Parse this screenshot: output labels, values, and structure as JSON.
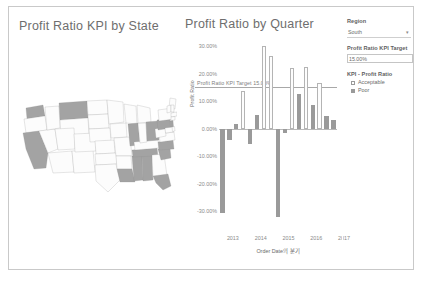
{
  "map_panel": {
    "title": "Profit Ratio KPI by State",
    "states": [
      {
        "name": "WA",
        "kpi": "Poor"
      },
      {
        "name": "OR",
        "kpi": "Acceptable"
      },
      {
        "name": "CA",
        "kpi": "Poor"
      },
      {
        "name": "NV",
        "kpi": "Acceptable"
      },
      {
        "name": "ID",
        "kpi": "Acceptable"
      },
      {
        "name": "MT",
        "kpi": "Poor"
      },
      {
        "name": "WY",
        "kpi": "Acceptable"
      },
      {
        "name": "UT",
        "kpi": "Acceptable"
      },
      {
        "name": "AZ",
        "kpi": "Acceptable"
      },
      {
        "name": "NM",
        "kpi": "Acceptable"
      },
      {
        "name": "CO",
        "kpi": "Acceptable"
      },
      {
        "name": "ND",
        "kpi": "Acceptable"
      },
      {
        "name": "SD",
        "kpi": "Acceptable"
      },
      {
        "name": "NE",
        "kpi": "Acceptable"
      },
      {
        "name": "KS",
        "kpi": "Acceptable"
      },
      {
        "name": "OK",
        "kpi": "Acceptable"
      },
      {
        "name": "TX",
        "kpi": "Acceptable"
      },
      {
        "name": "MN",
        "kpi": "Acceptable"
      },
      {
        "name": "IA",
        "kpi": "Acceptable"
      },
      {
        "name": "MO",
        "kpi": "Acceptable"
      },
      {
        "name": "AR",
        "kpi": "Acceptable"
      },
      {
        "name": "LA",
        "kpi": "Poor"
      },
      {
        "name": "WI",
        "kpi": "Acceptable"
      },
      {
        "name": "IL",
        "kpi": "Poor"
      },
      {
        "name": "MS",
        "kpi": "Poor"
      },
      {
        "name": "AL",
        "kpi": "Poor"
      },
      {
        "name": "TN",
        "kpi": "Poor"
      },
      {
        "name": "KY",
        "kpi": "Acceptable"
      },
      {
        "name": "IN",
        "kpi": "Acceptable"
      },
      {
        "name": "MI",
        "kpi": "Acceptable"
      },
      {
        "name": "OH",
        "kpi": "Poor"
      },
      {
        "name": "GA",
        "kpi": "Acceptable"
      },
      {
        "name": "FL",
        "kpi": "Poor"
      },
      {
        "name": "SC",
        "kpi": "Poor"
      },
      {
        "name": "NC",
        "kpi": "Poor"
      },
      {
        "name": "VA",
        "kpi": "Acceptable"
      },
      {
        "name": "WV",
        "kpi": "Acceptable"
      },
      {
        "name": "PA",
        "kpi": "Poor"
      },
      {
        "name": "NY",
        "kpi": "Acceptable"
      },
      {
        "name": "ME",
        "kpi": "Acceptable"
      },
      {
        "name": "VT",
        "kpi": "Acceptable"
      },
      {
        "name": "NH",
        "kpi": "Acceptable"
      },
      {
        "name": "MA",
        "kpi": "Acceptable"
      },
      {
        "name": "CT",
        "kpi": "Acceptable"
      },
      {
        "name": "NJ",
        "kpi": "Poor"
      },
      {
        "name": "MD",
        "kpi": "Acceptable"
      },
      {
        "name": "DE",
        "kpi": "Acceptable"
      }
    ]
  },
  "chart_panel": {
    "title": "Profit Ratio by Quarter"
  },
  "chart_data": {
    "type": "bar",
    "title": "Profit Ratio by Quarter",
    "xlabel": "Order Date의 분기",
    "ylabel": "Profit Ratio",
    "ylim": [
      -0.35,
      0.34
    ],
    "grid": false,
    "ytick_labels": [
      "30.00%",
      "20.00%",
      "10.00%",
      "0.00%",
      "-10.00%",
      "-20.00%",
      "-30.00%"
    ],
    "ytick_values": [
      0.3,
      0.2,
      0.1,
      0.0,
      -0.1,
      -0.2,
      -0.3
    ],
    "xtick_labels": [
      "2013",
      "2014",
      "2015",
      "2016",
      "2017"
    ],
    "reference_line": {
      "label": "Profit Ratio KPI Target",
      "value_label": "15.00%",
      "value": 0.15
    },
    "legend": {
      "title": "KPI - Profit Ratio",
      "entries": [
        {
          "label": "Acceptable",
          "color": "#ffffff"
        },
        {
          "label": "Poor",
          "color": "#9a9a9a"
        }
      ]
    },
    "categories": [
      "2013 Q1",
      "2013 Q2",
      "2013 Q3",
      "2013 Q4",
      "2014 Q1",
      "2014 Q2",
      "2014 Q3",
      "2014 Q4",
      "2015 Q1",
      "2015 Q2",
      "2015 Q3",
      "2015 Q4",
      "2016 Q1",
      "2016 Q2",
      "2016 Q3",
      "2016 Q4",
      "2017 Q1"
    ],
    "values": [
      -0.305,
      -0.04,
      0.018,
      0.135,
      -0.055,
      0.05,
      0.3,
      0.265,
      -0.32,
      -0.015,
      0.22,
      0.125,
      0.225,
      0.085,
      0.165,
      0.045,
      0.03
    ],
    "kpi": [
      "Poor",
      "Poor",
      "Poor",
      "Acceptable",
      "Poor",
      "Poor",
      "Acceptable",
      "Acceptable",
      "Poor",
      "Poor",
      "Acceptable",
      "Poor",
      "Acceptable",
      "Poor",
      "Acceptable",
      "Poor",
      "Poor"
    ]
  },
  "controls": {
    "region": {
      "label": "Region",
      "value": "South",
      "caret": "chevron-down-icon"
    },
    "target": {
      "label": "Profit Ratio KPI Target",
      "value": "15.00%"
    },
    "legend": {
      "title": "KPI - Profit Ratio",
      "items": [
        {
          "label": "Acceptable",
          "state": "empty"
        },
        {
          "label": "Poor",
          "state": "filled"
        }
      ]
    }
  }
}
